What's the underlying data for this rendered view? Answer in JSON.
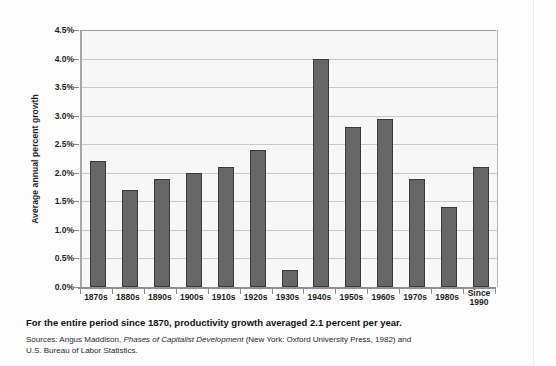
{
  "chart_data": {
    "type": "bar",
    "title": "",
    "xlabel": "",
    "ylabel": "Average annual percent growth",
    "ylim": [
      0.0,
      4.5
    ],
    "ytick_step": 0.5,
    "ytick_labels": [
      "0.0%",
      "0.5%",
      "1.0%",
      "1.5%",
      "2.0%",
      "2.5%",
      "3.0%",
      "3.5%",
      "4.0%",
      "4.5%"
    ],
    "ytick_values": [
      0.0,
      0.5,
      1.0,
      1.5,
      2.0,
      2.5,
      3.0,
      3.5,
      4.0,
      4.5
    ],
    "grid": true,
    "legend": "none",
    "categories": [
      "1870s",
      "1880s",
      "1890s",
      "1900s",
      "1910s",
      "1920s",
      "1930s",
      "1940s",
      "1950s",
      "1960s",
      "1970s",
      "1980s",
      "Since 1990"
    ],
    "category_labels_multiline": [
      [
        "1870s"
      ],
      [
        "1880s"
      ],
      [
        "1890s"
      ],
      [
        "1900s"
      ],
      [
        "1910s"
      ],
      [
        "1920s"
      ],
      [
        "1930s"
      ],
      [
        "1940s"
      ],
      [
        "1950s"
      ],
      [
        "1960s"
      ],
      [
        "1970s"
      ],
      [
        "1980s"
      ],
      [
        "Since",
        "1990"
      ]
    ],
    "values": [
      2.2,
      1.7,
      1.9,
      2.0,
      2.1,
      2.4,
      0.3,
      4.0,
      2.8,
      2.95,
      1.9,
      1.4,
      2.1
    ],
    "units": "percent",
    "bar_color": "#666666",
    "bar_edge_color": "#3a3a3a",
    "plot_background": "#f7f7f7",
    "gridline_color": "#c9c9c9",
    "axis_color": "#8f8f8f"
  },
  "caption": {
    "main": "For the entire period since 1870, productivity growth averaged 2.1 percent per year.",
    "sources_prefix": "Sources: Angus Maddison, ",
    "sources_title": "Phases of Capitalist Development",
    "sources_suffix": " (New York: Oxford University Press, 1982) and U.S. Bureau of Labor Statistics."
  }
}
